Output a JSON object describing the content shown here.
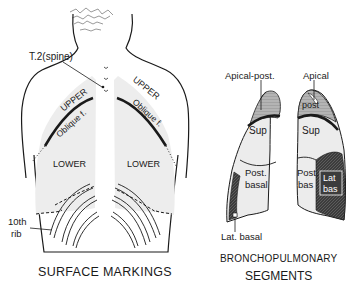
{
  "surface_markings": {
    "title": "SURFACE MARKINGS",
    "labels": {
      "spine": "T.2(spine)",
      "upper_left": "UPPER",
      "upper_right": "UPPER",
      "oblique_left": "Oblique f.",
      "oblique_right": "Oblique f.",
      "lower_left": "LOWER",
      "lower_right": "LOWER",
      "rib_line1": "10th",
      "rib_line2": "rib"
    }
  },
  "bronchopulmonary": {
    "title_line1": "BRONCHOPULMONARY",
    "title_line2": "SEGMENTS",
    "labels": {
      "apical_post": "Apical-post.",
      "apical": "Apical",
      "post": "post",
      "sup_left": "Sup",
      "sup_right": "Sup",
      "post_basal_line1": "Post.",
      "post_basal_line2": "basal",
      "post_bas_line1": "Post.",
      "post_bas_line2": "bas",
      "lat_bas_line1": "Lat",
      "lat_bas_line2": "bas",
      "lat_basal": "Lat. basal"
    }
  },
  "colors": {
    "ink": "#1a1a1a",
    "lung_fill": "#ececec",
    "apical_shade": "#a9a9a9",
    "basal_dark": "#3a3a3a"
  }
}
